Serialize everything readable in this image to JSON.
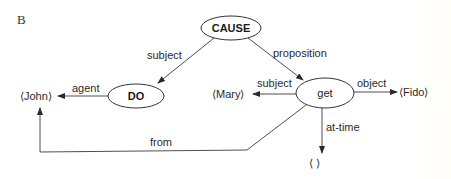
{
  "panel_label": "B",
  "nodes": {
    "cause": {
      "label": "CAUSE",
      "bold": true
    },
    "do": {
      "label": "DO",
      "bold": true
    },
    "get": {
      "label": "get",
      "bold": false
    }
  },
  "terminals": {
    "john": "⟨John⟩",
    "mary": "⟨Mary⟩",
    "fido": "⟨Fido⟩",
    "time": "⟨      ⟩"
  },
  "edges": {
    "cause_do": "subject",
    "cause_get": "proposition",
    "do_john": "agent",
    "get_mary": "subject",
    "get_fido": "object",
    "get_time": "at-time",
    "get_john": "from"
  },
  "colors": {
    "line": "#3a3a3a",
    "text": "#2a2a2a",
    "background": "#ffffff"
  }
}
